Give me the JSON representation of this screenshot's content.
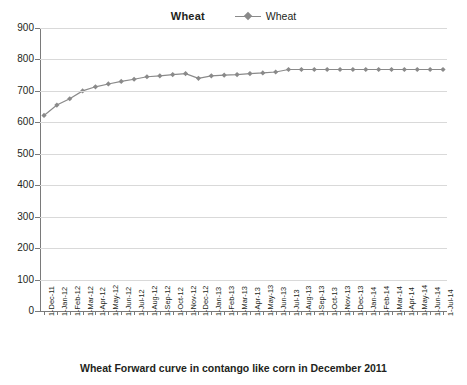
{
  "chart_data": {
    "type": "line",
    "title": "Wheat",
    "xlabel": "Wheat Forward curve in contango like corn in December 2011",
    "ylabel": "",
    "ylim": [
      0,
      900
    ],
    "ytick_step": 100,
    "yticks": [
      "900",
      "800",
      "700",
      "600",
      "500",
      "400",
      "300",
      "200",
      "100",
      "0"
    ],
    "grid": true,
    "legend_position": "top",
    "series_color": "#8a8a8a",
    "marker": "diamond",
    "legend": [
      "Wheat"
    ],
    "categories": [
      "1-Dec-11",
      "1-Jan-12",
      "1-Feb-12",
      "1-Mar-12",
      "1-Apr-12",
      "1-May-12",
      "1-Jun-12",
      "1-Jul-12",
      "1-Aug-12",
      "1-Sep-12",
      "1-Oct-12",
      "1-Nov-12",
      "1-Dec-12",
      "1-Jan-13",
      "1-Feb-13",
      "1-Mar-13",
      "1-Apr-13",
      "1-May-13",
      "1-Jun-13",
      "1-Jul-13",
      "1-Aug-13",
      "1-Sep-13",
      "1-Oct-13",
      "1-Nov-13",
      "1-Dec-13",
      "1-Jan-14",
      "1-Feb-14",
      "1-Mar-14",
      "1-Apr-14",
      "1-May-14",
      "1-Jun-14",
      "1-Jul-14"
    ],
    "series": [
      {
        "name": "Wheat",
        "values": [
          622,
          655,
          675,
          700,
          713,
          722,
          730,
          737,
          745,
          748,
          752,
          755,
          740,
          748,
          750,
          752,
          755,
          757,
          760,
          768,
          768,
          768,
          768,
          768,
          768,
          768,
          768,
          768,
          768,
          768,
          768,
          768
        ]
      }
    ]
  },
  "axis": {
    "x_tick_labels": [
      "1-Dec-11",
      "1-Jan-12",
      "1-Feb-12",
      "1-Mar-12",
      "1-Apr-12",
      "1-May-12",
      "1-Jun-12",
      "1-Jul-12",
      "1-Aug-12",
      "1-Sep-12",
      "1-Oct-12",
      "1-Nov-12",
      "1-Dec-12",
      "1-Jan-13",
      "1-Feb-13",
      "1-Mar-13",
      "1-Apr-13",
      "1-May-13",
      "1-Jun-13",
      "1-Jul-13",
      "1-Aug-13",
      "1-Sep-13",
      "1-Oct-13",
      "1-Nov-13",
      "1-Dec-13",
      "1-Jan-14",
      "1-Feb-14",
      "1-Mar-14",
      "1-Apr-14",
      "1-May-14",
      "1-Jun-14",
      "1-Jul-14"
    ],
    "y_tick_labels": [
      "900",
      "800",
      "700",
      "600",
      "500",
      "400",
      "300",
      "200",
      "100",
      "0"
    ]
  },
  "legend": {
    "entries": [
      {
        "label": "Wheat",
        "color": "#8a8a8a",
        "marker": "diamond-marker"
      }
    ]
  },
  "footer": {
    "caption": "Wheat Forward curve in contango like corn in December 2011"
  }
}
